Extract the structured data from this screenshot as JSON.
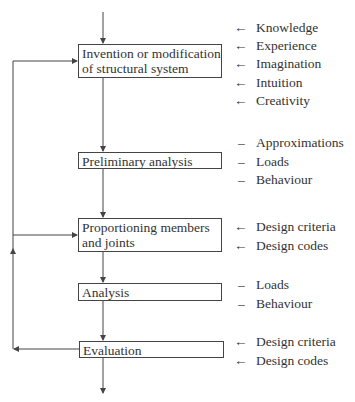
{
  "diagram": {
    "type": "flowchart",
    "steps": [
      {
        "id": "invention",
        "lines": [
          "Invention or modification",
          "of structural system"
        ]
      },
      {
        "id": "preliminary",
        "lines": [
          "Preliminary analysis"
        ]
      },
      {
        "id": "proportioning",
        "lines": [
          "Proportioning members",
          "and joints"
        ]
      },
      {
        "id": "analysis",
        "lines": [
          "Analysis"
        ]
      },
      {
        "id": "evaluation",
        "lines": [
          "Evaluation"
        ]
      }
    ],
    "inputs": {
      "invention": {
        "marker": "←",
        "items": [
          "Knowledge",
          "Experience",
          "Imagination",
          "Intuition",
          "Creativity"
        ]
      },
      "preliminary": {
        "marker": "–",
        "items": [
          "Approximations",
          "Loads",
          "Behaviour"
        ]
      },
      "proportioning": {
        "marker": "←",
        "items": [
          "Design criteria",
          "Design codes"
        ]
      },
      "analysis": {
        "marker": "–",
        "items": [
          "Loads",
          "Behaviour"
        ]
      },
      "evaluation": {
        "marker": "←",
        "items": [
          "Design criteria",
          "Design codes"
        ]
      }
    },
    "feedback_loop": {
      "from": "evaluation",
      "to": [
        "proportioning",
        "invention"
      ]
    },
    "line_color": "#444444"
  }
}
